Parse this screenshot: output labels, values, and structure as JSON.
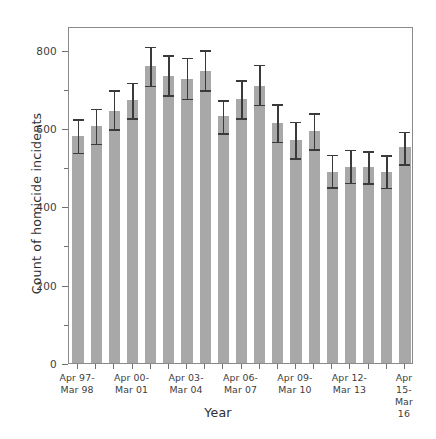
{
  "chart_data": {
    "type": "bar",
    "title": "",
    "xlabel": "Year",
    "ylabel": "Count of homicide incidents",
    "ylim": [
      0,
      860
    ],
    "yticks": [
      0,
      200,
      400,
      600,
      800
    ],
    "ytick_labels": [
      "0",
      "200",
      "400",
      "600",
      "800"
    ],
    "yticks_minor": [
      100,
      300,
      500,
      700
    ],
    "grid": false,
    "legend": null,
    "bar_color": "#a8a8a8",
    "errorbar_color": "#3a3a3a",
    "categories": [
      "Apr 97-\nMar 98",
      "Apr 98-\nMar 99",
      "Apr 99-\nMar 00",
      "Apr 00-\nMar 01",
      "Apr 01-\nMar 02",
      "Apr 02-\nMar 03",
      "Apr 03-\nMar 04",
      "Apr 04-\nMar 05",
      "Apr 05-\nMar 06",
      "Apr 06-\nMar 07",
      "Apr 07-\nMar 08",
      "Apr 08-\nMar 09",
      "Apr 09-\nMar 10",
      "Apr 10-\nMar 11",
      "Apr 11-\nMar 12",
      "Apr 12-\nMar 13",
      "Apr 13-\nMar 14",
      "Apr 14-\nMar 15",
      "Apr 15-\nMar 16"
    ],
    "xtick_labels_visible": [
      {
        "index": 0,
        "label": "Apr 97-\nMar 98"
      },
      {
        "index": 3,
        "label": "Apr 00-\nMar 01"
      },
      {
        "index": 6,
        "label": "Apr 03-\nMar 04"
      },
      {
        "index": 9,
        "label": "Apr 06-\nMar 07"
      },
      {
        "index": 12,
        "label": "Apr 09-\nMar 10"
      },
      {
        "index": 15,
        "label": "Apr 12-\nMar 13"
      },
      {
        "index": 18,
        "label": "Apr 15-\nMar 16"
      }
    ],
    "values": [
      580,
      605,
      643,
      672,
      757,
      732,
      726,
      746,
      630,
      673,
      707,
      613,
      568,
      591,
      488,
      501,
      501,
      488,
      551
    ],
    "err_lower": [
      538,
      561,
      598,
      625,
      709,
      685,
      676,
      697,
      588,
      626,
      660,
      566,
      523,
      547,
      450,
      461,
      460,
      448,
      508
    ],
    "err_upper": [
      628,
      654,
      702,
      720,
      812,
      791,
      784,
      804,
      675,
      727,
      766,
      665,
      621,
      643,
      537,
      549,
      546,
      535,
      595
    ]
  }
}
